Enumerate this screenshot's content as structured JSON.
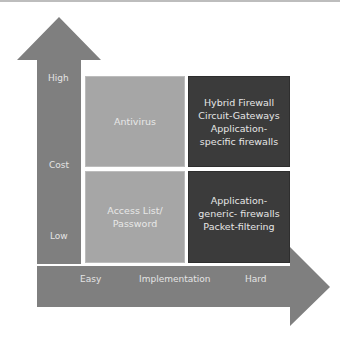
{
  "diagram": {
    "y_axis": {
      "title": "Cost",
      "high_label": "High",
      "low_label": "Low"
    },
    "x_axis": {
      "title": "Implementation",
      "easy_label": "Easy",
      "hard_label": "Hard"
    },
    "quadrants": {
      "top_left": {
        "lines": [
          "Antivirus"
        ]
      },
      "bottom_left": {
        "lines": [
          "Access List/",
          "Password"
        ]
      },
      "top_right": {
        "lines": [
          "Hybrid Firewall",
          "Circuit-Gateways",
          "Application-",
          "specific firewalls"
        ]
      },
      "bottom_right": {
        "lines": [
          "Application-",
          "generic- firewalls",
          "Packet-filtering"
        ]
      }
    },
    "colors": {
      "arrow": "#7f7f7f",
      "light_box": "#a6a6a6",
      "dark_box": "#3b3b3b",
      "text": "#e6e6e6"
    }
  }
}
